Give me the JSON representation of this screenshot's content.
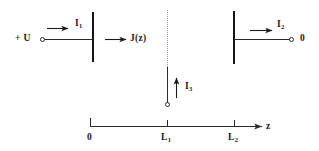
{
  "figure": {
    "type": "physics-schematic",
    "background_color": "#ffffff",
    "line_color": "#1a1a1a",
    "dotted_line_color": "#9a9a9a"
  },
  "labels": {
    "voltage_source": "+ U",
    "ground": "0",
    "current_1": "I",
    "current_1_sub": "1",
    "current_2": "I",
    "current_2_sub": "2",
    "current_3": "I",
    "current_3_sub": "3",
    "current_density": "J(z)",
    "axis_name": "z"
  },
  "axis": {
    "name": "z",
    "ticks": [
      {
        "label": "0",
        "sub": "",
        "x": 90
      },
      {
        "label": "L",
        "sub": "1",
        "x": 167
      },
      {
        "label": "L",
        "sub": "2",
        "x": 234
      }
    ]
  },
  "elements": {
    "left_electrode": {
      "x": 92,
      "y_top": 12,
      "y_bottom": 62
    },
    "right_electrode": {
      "x": 234,
      "y_top": 11,
      "y_bottom": 64
    },
    "probe_line": {
      "x": 167,
      "y_top": 67,
      "y_bottom": 104
    },
    "dotted_divider": {
      "x": 167,
      "y_top": 10,
      "y_bottom": 67
    }
  }
}
